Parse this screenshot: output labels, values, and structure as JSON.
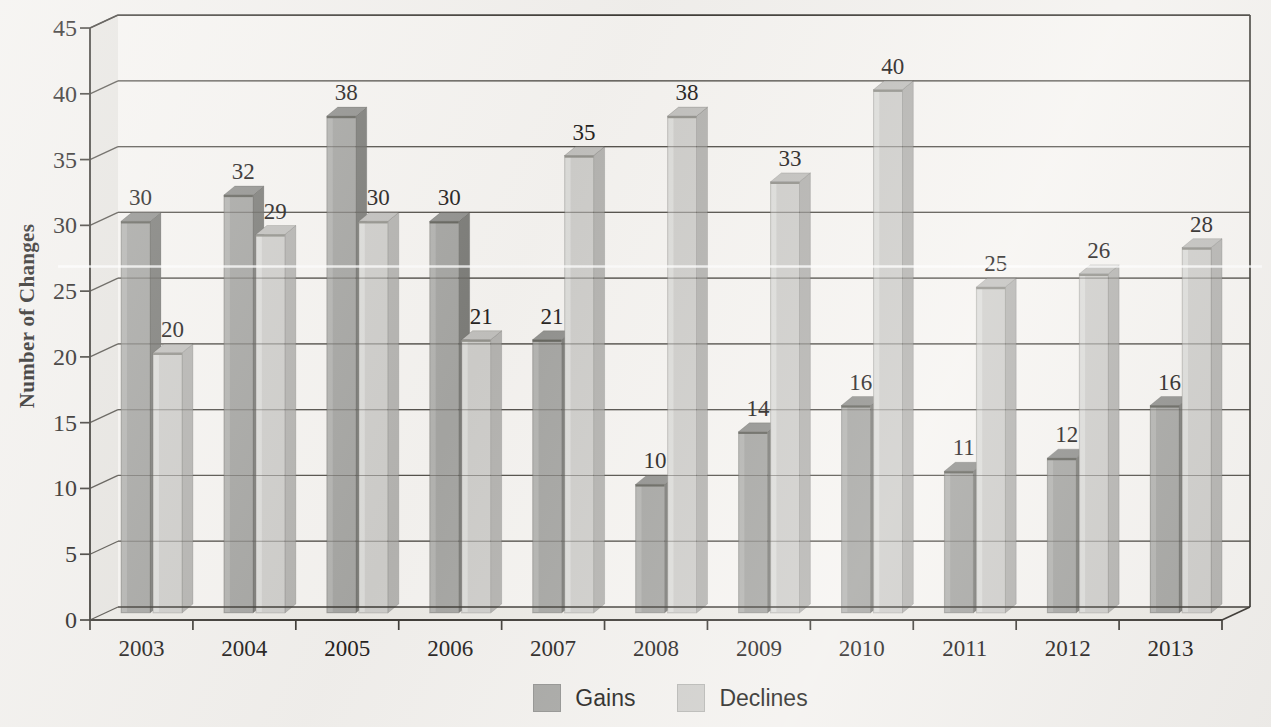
{
  "chart_data": {
    "type": "bar",
    "subtype": "3d-clustered-column",
    "title": "",
    "xlabel": "",
    "ylabel": "Number of Changes",
    "categories": [
      "2003",
      "2004",
      "2005",
      "2006",
      "2007",
      "2008",
      "2009",
      "2010",
      "2011",
      "2012",
      "2013"
    ],
    "series": [
      {
        "name": "Gains",
        "color": "#a6a6a3",
        "side_color": "#7d7d79",
        "top_color": "#92928f",
        "edge_color": "#66665f",
        "values": [
          30,
          32,
          38,
          30,
          21,
          10,
          14,
          16,
          11,
          12,
          16
        ]
      },
      {
        "name": "Declines",
        "color": "#cfcecb",
        "side_color": "#b5b4b1",
        "top_color": "#c2c1be",
        "edge_color": "#94938d",
        "values": [
          20,
          29,
          30,
          21,
          35,
          38,
          33,
          40,
          25,
          26,
          28
        ]
      }
    ],
    "ylim": [
      0,
      45
    ],
    "ytick_step": 5,
    "yticks": [
      0,
      5,
      10,
      15,
      20,
      25,
      30,
      35,
      40,
      45
    ],
    "grid": true,
    "gridlines_over_bars": true,
    "data_labels": true,
    "legend_position": "bottom",
    "colors": {
      "axis": "#3e3b36",
      "gridline": "#55524c",
      "label_text": "#26231e",
      "paper": "#f3f1ee",
      "plot_bg": "#f6f4f1",
      "left_wall": "#e8e6e2",
      "floor": "#edebe6",
      "scan_crease": "#ffffff"
    }
  }
}
